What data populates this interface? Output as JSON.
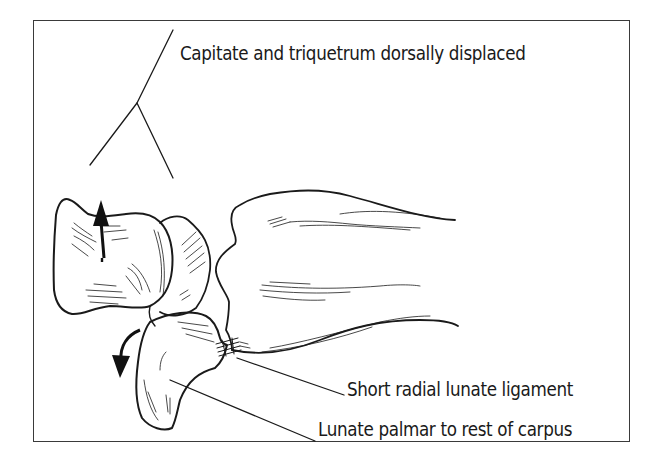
{
  "figure": {
    "type": "anatomical line illustration",
    "labels": {
      "capitate_triquetrum": "Capitate and triquetrum dorsally displaced",
      "ligament": "Short radial lunate ligament",
      "lunate": "Lunate palmar to rest of carpus"
    },
    "structures": [
      {
        "name": "capitate",
        "role": "dorsally displaced carpal bone"
      },
      {
        "name": "triquetrum",
        "role": "dorsally displaced carpal bone"
      },
      {
        "name": "lunate",
        "role": "palmarly dislocated carpal bone"
      },
      {
        "name": "radius",
        "role": "distal forearm bone"
      },
      {
        "name": "short-radial-lunate-ligament",
        "role": "ligament connecting radius to lunate"
      }
    ],
    "arrows": [
      {
        "name": "dorsal-displacement-arrow",
        "direction": "up"
      },
      {
        "name": "palmar-rotation-arrow",
        "direction": "curved down"
      }
    ],
    "colors": {
      "ink": "#1a1a1a",
      "frame": "#3a3a3a",
      "background": "#ffffff"
    }
  }
}
